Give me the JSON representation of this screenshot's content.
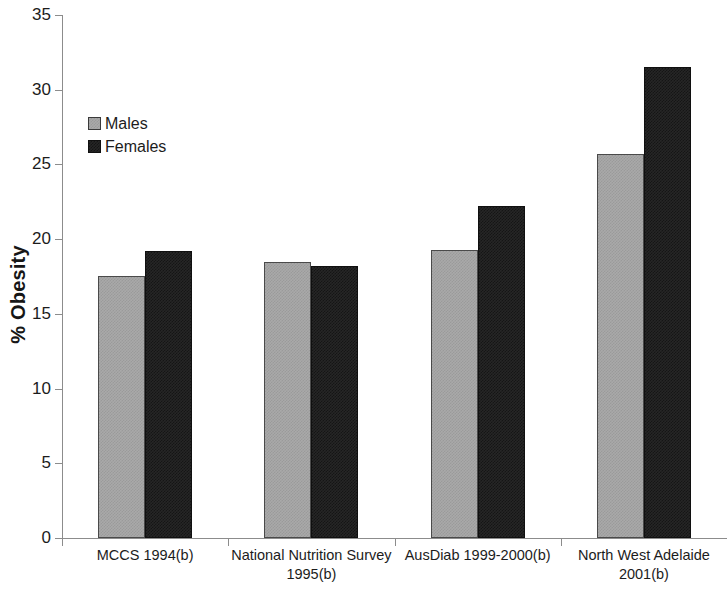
{
  "chart_data": {
    "type": "bar",
    "title": "",
    "subtitle": "",
    "xlabel": "",
    "ylabel": "% Obesity",
    "ylim": [
      0,
      35
    ],
    "yticks": [
      0,
      5,
      10,
      15,
      20,
      25,
      30,
      35
    ],
    "ytick_labels": [
      "0",
      "5",
      "10",
      "15",
      "20",
      "25",
      "30",
      "35"
    ],
    "grid": false,
    "legend_position": "upper-left-inside",
    "categories": [
      "MCCS 1994(b)",
      "National Nutrition Survey 1995(b)",
      "AusDiab 1999-2000(b)",
      "North West Adelaide 2001(b)"
    ],
    "category_lines": [
      [
        "MCCS 1994(b)"
      ],
      [
        "National Nutrition Survey",
        "1995(b)"
      ],
      [
        "AusDiab 1999-2000(b)"
      ],
      [
        "North West Adelaide",
        "2001(b)"
      ]
    ],
    "series": [
      {
        "name": "Males",
        "color": "#a9a9a9",
        "values": [
          17.5,
          18.5,
          19.3,
          25.7
        ]
      },
      {
        "name": "Females",
        "color": "#262626",
        "values": [
          19.2,
          18.2,
          22.2,
          31.5
        ]
      }
    ]
  },
  "legend": {
    "items": [
      {
        "label": "Males"
      },
      {
        "label": "Females"
      }
    ]
  },
  "axis": {
    "y_title": "% Obesity"
  }
}
